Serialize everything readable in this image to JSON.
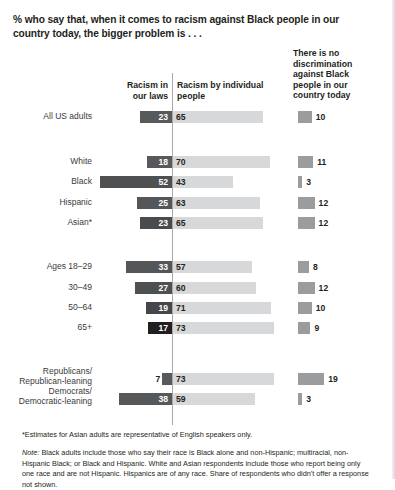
{
  "title": "% who say that, when it comes to racism against Black people in our country today, the bigger problem is . . .",
  "colors": {
    "bar_laws": "#58595b",
    "bar_people": "#d7d8d9",
    "bar_nodisc": "#9b9c9e",
    "divider": "#a7a9ac",
    "text": "#231f20"
  },
  "headers": {
    "laws": "Racism in our laws",
    "people": "Racism by individual people",
    "nodisc": "There is no discrimination against Black people in our country today"
  },
  "footnotes": {
    "asterisk": "*Estimates for Asian adults are representative of English speakers only.",
    "note_label": "Note:",
    "note_body": " Black adults include those who say their race is Black alone and non-Hispanic; multiracial, non-Hispanic Black; or Black and Hispanic. White and Asian respondents include those who report being only one race and are not Hispanic. Hispanics are of any race. Share of respondents who didn't offer a response not shown."
  },
  "chart_data": {
    "type": "bar",
    "title": "% who say that, when it comes to racism against Black people in our country today, the bigger problem is . . .",
    "xlabel": "",
    "ylabel": "",
    "grid": false,
    "legend_position": "column-headers",
    "categories": [
      "All US adults",
      "White",
      "Black",
      "Hispanic",
      "Asian*",
      "Ages 18–29",
      "30–49",
      "50–64",
      "65+",
      "Republicans/ Republican-leaning",
      "Democrats/ Democratic-leaning"
    ],
    "series": [
      {
        "name": "Racism in our laws",
        "values": [
          23,
          18,
          52,
          25,
          23,
          33,
          27,
          19,
          17,
          7,
          38
        ]
      },
      {
        "name": "Racism by individual people",
        "values": [
          65,
          70,
          43,
          63,
          65,
          57,
          60,
          71,
          73,
          73,
          59
        ]
      },
      {
        "name": "There is no discrimination against Black people in our country today",
        "values": [
          10,
          11,
          3,
          12,
          12,
          8,
          12,
          10,
          9,
          19,
          3
        ]
      }
    ]
  },
  "rows": [
    {
      "label": "All US adults",
      "label_lines": [
        "All US adults"
      ],
      "laws": 23,
      "people": 65,
      "nodisc": 10,
      "top": 110,
      "label_style": "one-line",
      "laws_shade": "#58595b",
      "laws_inside": true
    },
    {
      "label": "White",
      "label_lines": [
        "White"
      ],
      "laws": 18,
      "people": 70,
      "nodisc": 11,
      "top": 155,
      "label_style": "one-line",
      "laws_shade": "#58595b",
      "laws_inside": true
    },
    {
      "label": "Black",
      "label_lines": [
        "Black"
      ],
      "laws": 52,
      "people": 43,
      "nodisc": 3,
      "top": 175,
      "label_style": "one-line",
      "laws_shade": "#4f5052",
      "laws_inside": true
    },
    {
      "label": "Hispanic",
      "label_lines": [
        "Hispanic"
      ],
      "laws": 25,
      "people": 63,
      "nodisc": 12,
      "top": 196,
      "label_style": "one-line",
      "laws_shade": "#54565a",
      "laws_inside": true
    },
    {
      "label": "Asian*",
      "label_lines": [
        "Asian*"
      ],
      "laws": 23,
      "people": 65,
      "nodisc": 12,
      "top": 216,
      "label_style": "one-line",
      "laws_shade": "#4a4b4d",
      "laws_inside": true
    },
    {
      "label": "Ages 18–29",
      "label_lines": [
        "Ages 18–29"
      ],
      "laws": 33,
      "people": 57,
      "nodisc": 8,
      "top": 260,
      "label_style": "one-line",
      "laws_shade": "#555658",
      "laws_inside": true
    },
    {
      "label": "30–49",
      "label_lines": [
        "30–49"
      ],
      "laws": 27,
      "people": 60,
      "nodisc": 12,
      "top": 281,
      "label_style": "one-line",
      "laws_shade": "#4e5052",
      "laws_inside": true
    },
    {
      "label": "50–64",
      "label_lines": [
        "50–64"
      ],
      "laws": 19,
      "people": 71,
      "nodisc": 10,
      "top": 301,
      "label_style": "one-line",
      "laws_shade": "#46474a",
      "laws_inside": true
    },
    {
      "label": "65+",
      "label_lines": [
        "65+"
      ],
      "laws": 17,
      "people": 73,
      "nodisc": 9,
      "top": 321,
      "label_style": "one-line",
      "laws_shade": "#221f20",
      "laws_inside": true
    },
    {
      "label": "Republicans/ Republican-leaning",
      "label_lines": [
        "Republicans/",
        "Republican-leaning"
      ],
      "laws": 7,
      "people": 73,
      "nodisc": 19,
      "top": 372,
      "label_style": "two-line",
      "laws_shade": "#58595b",
      "laws_inside": false
    },
    {
      "label": "Democrats/ Democratic-leaning",
      "label_lines": [
        "Democrats/",
        "Democratic-leaning"
      ],
      "laws": 38,
      "people": 59,
      "nodisc": 3,
      "top": 392,
      "label_style": "two-line",
      "laws_shade": "#56585a",
      "laws_inside": true
    }
  ]
}
